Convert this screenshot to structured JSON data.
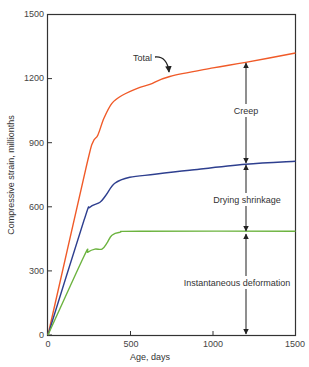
{
  "chart_data": {
    "type": "line",
    "title": "",
    "xlabel": "Age, days",
    "ylabel": "Compressive strain, millionths",
    "xlim": [
      0,
      1500
    ],
    "ylim": [
      0,
      1500
    ],
    "x_ticks": [
      0,
      500,
      1000,
      1500
    ],
    "y_ticks": [
      0,
      300,
      600,
      900,
      1200,
      1500
    ],
    "grid": false,
    "legend": "none (inline annotations)",
    "series": [
      {
        "name": "Total",
        "color": "#f05a28",
        "points": [
          [
            0,
            0
          ],
          [
            230,
            780
          ],
          [
            272,
            902
          ],
          [
            302,
            935
          ],
          [
            339,
            1014
          ],
          [
            387,
            1084
          ],
          [
            448,
            1121
          ],
          [
            557,
            1159
          ],
          [
            617,
            1173
          ],
          [
            738,
            1210
          ],
          [
            1000,
            1250
          ],
          [
            1198,
            1276
          ],
          [
            1500,
            1320
          ]
        ]
      },
      {
        "name": "Instantaneous deformation + Drying shrinkage",
        "color": "#2e3f8f",
        "points": [
          [
            0,
            0
          ],
          [
            218,
            537
          ],
          [
            254,
            598
          ],
          [
            315,
            621
          ],
          [
            351,
            654
          ],
          [
            405,
            710
          ],
          [
            496,
            738
          ],
          [
            647,
            752
          ],
          [
            859,
            771
          ],
          [
            1198,
            799
          ],
          [
            1500,
            813
          ]
        ]
      },
      {
        "name": "Instantaneous deformation",
        "color": "#6cb33f",
        "points": [
          [
            0,
            0
          ],
          [
            218,
            369
          ],
          [
            242,
            388
          ],
          [
            284,
            402
          ],
          [
            327,
            402
          ],
          [
            357,
            430
          ],
          [
            387,
            467
          ],
          [
            436,
            481
          ],
          [
            557,
            486
          ],
          [
            1500,
            486
          ]
        ]
      }
    ],
    "annotations": [
      {
        "text": "Total",
        "type": "label-with-curved-arrow",
        "points_to_series": "Total",
        "arrow_target": [
          740,
          1210
        ]
      },
      {
        "text": "Creep",
        "type": "double-arrow",
        "x": 1200,
        "from": 799,
        "to": 1276
      },
      {
        "text": "Drying shrinkage",
        "type": "double-arrow",
        "x": 1200,
        "from": 486,
        "to": 799
      },
      {
        "text": "Instantaneous deformation",
        "type": "double-arrow",
        "x": 1200,
        "from": 0,
        "to": 486
      }
    ]
  },
  "labels": {
    "xlabel": "Age, days",
    "ylabel": "Compressive strain, millionths",
    "total": "Total",
    "creep": "Creep",
    "drying": "Drying shrinkage",
    "instant": "Instantaneous deformation"
  },
  "ticks": {
    "x": [
      "0",
      "500",
      "1000",
      "1500"
    ],
    "y": [
      "0",
      "300",
      "600",
      "900",
      "1200",
      "1500"
    ]
  }
}
